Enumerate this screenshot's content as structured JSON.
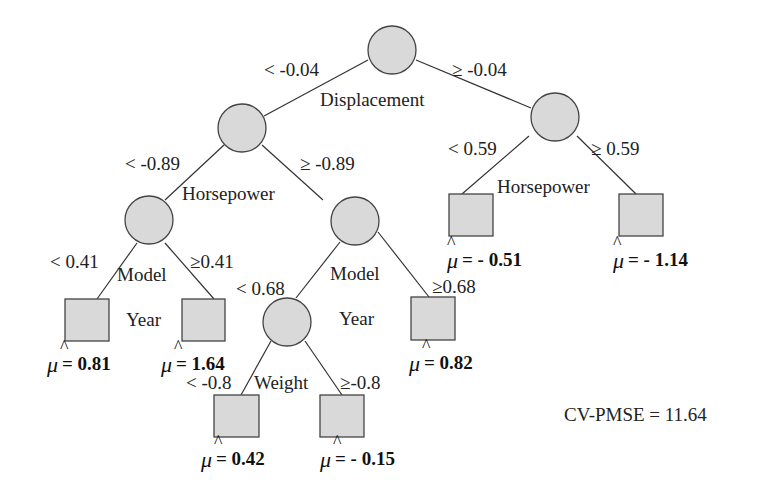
{
  "diagram": {
    "type": "regression-tree",
    "split_nodes": [
      {
        "id": "root",
        "variable": "Displacement",
        "cx": 392,
        "cy": 50,
        "left_label": "< -0.04",
        "right_label": "≥ -0.04"
      },
      {
        "id": "n_left",
        "variable": "Horsepower",
        "cx": 242,
        "cy": 128,
        "left_label": "< -0.89",
        "right_label": "≥ -0.89"
      },
      {
        "id": "n_right",
        "variable": "Horsepower",
        "cx": 555,
        "cy": 117,
        "left_label": "< 0.59",
        "right_label": "≥ 0.59"
      },
      {
        "id": "n_ll",
        "variable_line1": "Model",
        "variable_line2": "Year",
        "cx": 149,
        "cy": 220,
        "left_label": "< 0.41",
        "right_label": "≥0.41"
      },
      {
        "id": "n_lr",
        "variable_line1": "Model",
        "variable_line2": "Year",
        "cx": 355,
        "cy": 221,
        "left_label": "< 0.68",
        "right_label": "≥0.68"
      },
      {
        "id": "n_lrl",
        "variable": "Weight",
        "cx": 287,
        "cy": 322,
        "left_label": "< -0.8",
        "right_label": "≥-0.8"
      }
    ],
    "leaves": [
      {
        "id": "leaf_1",
        "symbol": "μ",
        "hat": "^",
        "value_text": "= 0.81",
        "value": 0.81
      },
      {
        "id": "leaf_2",
        "symbol": "μ",
        "hat": "^",
        "value_text": "= 1.64",
        "value": 1.64
      },
      {
        "id": "leaf_3",
        "symbol": "μ",
        "hat": "^",
        "value_text": "= 0.42",
        "value": 0.42
      },
      {
        "id": "leaf_4",
        "symbol": "μ",
        "hat": "^",
        "value_text": "= - 0.15",
        "value": -0.15
      },
      {
        "id": "leaf_5",
        "symbol": "μ",
        "hat": "^",
        "value_text": "= 0.82",
        "value": 0.82
      },
      {
        "id": "leaf_6",
        "symbol": "μ",
        "hat": "^",
        "value_text": "= - 0.51",
        "value": -0.51
      },
      {
        "id": "leaf_7",
        "symbol": "μ",
        "hat": "^",
        "value_text": "= - 1.14",
        "value": -1.14
      }
    ],
    "cv_pmse": "CV-PMSE = 11.64",
    "colors": {
      "node_fill": "#d9d9d9",
      "stroke": "#444444",
      "text": "#222222"
    }
  }
}
